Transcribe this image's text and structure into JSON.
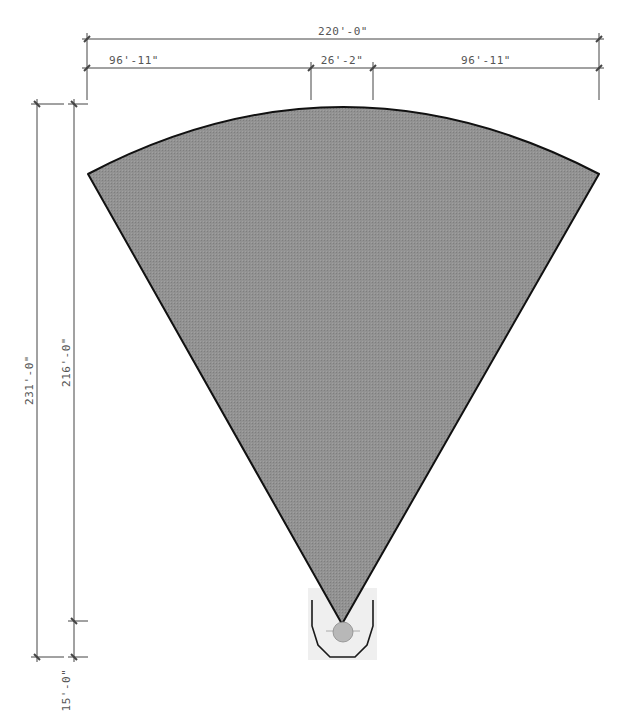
{
  "diagram": {
    "type": "field-layout-plan",
    "shape": "sector",
    "colors": {
      "field_fill": "#8f8f8f",
      "field_outline": "#111111",
      "pocket_fill": "#efefef",
      "pocket_outline": "#1a1a1a",
      "circle_fill": "#b5b5b5",
      "dimension_line": "#444444",
      "dimension_text": "#555555"
    }
  },
  "dimensions": {
    "overall_width": "220'-0\"",
    "left_segment": "96'-11\"",
    "center_segment": "26'-2\"",
    "right_segment": "96'-11\"",
    "overall_length": "231'-0\"",
    "sector_length": "216'-0\"",
    "pocket_length": "15'-0\""
  }
}
